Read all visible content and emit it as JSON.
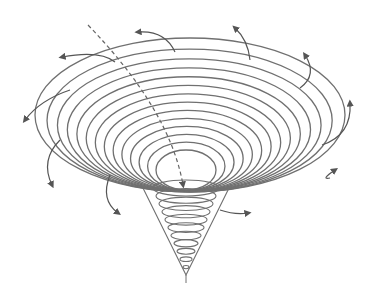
{
  "diagram": {
    "type": "vortex-funnel",
    "colors": {
      "line": "#707070",
      "arrow": "#555555",
      "background": "#ffffff"
    },
    "rings": {
      "count": 14,
      "outer": {
        "cx": 190,
        "top": 38,
        "rx": 155,
        "bottom": 192
      },
      "inner": {
        "cx": 186,
        "top": 150,
        "rx": 30,
        "bottom": 190
      }
    },
    "cone": {
      "top_y": 188,
      "half_width": 33,
      "tip": [
        186,
        275
      ],
      "coils": 11
    },
    "arrows": [
      {
        "from": [
          175,
          52
        ],
        "ctrl": [
          165,
          30
        ],
        "to": [
          138,
          32
        ]
      },
      {
        "from": [
          250,
          60
        ],
        "ctrl": [
          248,
          40
        ],
        "to": [
          235,
          28
        ]
      },
      {
        "from": [
          115,
          62
        ],
        "ctrl": [
          100,
          50
        ],
        "to": [
          62,
          57
        ]
      },
      {
        "from": [
          300,
          88
        ],
        "ctrl": [
          318,
          75
        ],
        "to": [
          305,
          55
        ]
      },
      {
        "from": [
          70,
          90
        ],
        "ctrl": [
          40,
          100
        ],
        "to": [
          25,
          120
        ]
      },
      {
        "from": [
          322,
          145
        ],
        "ctrl": [
          352,
          135
        ],
        "to": [
          350,
          103
        ]
      },
      {
        "from": [
          60,
          140
        ],
        "ctrl": [
          40,
          160
        ],
        "to": [
          52,
          185
        ]
      },
      {
        "from": [
          330,
          178
        ],
        "ctrl": [
          320,
          180
        ],
        "to": [
          335,
          170
        ]
      },
      {
        "from": [
          110,
          175
        ],
        "ctrl": [
          100,
          200
        ],
        "to": [
          118,
          213
        ]
      },
      {
        "from": [
          220,
          210
        ],
        "ctrl": [
          235,
          215
        ],
        "to": [
          248,
          213
        ]
      }
    ],
    "axis_path": {
      "start": [
        88,
        25
      ],
      "ctrl": [
        170,
        110
      ],
      "end": [
        183,
        185
      ],
      "dashed": true
    }
  }
}
